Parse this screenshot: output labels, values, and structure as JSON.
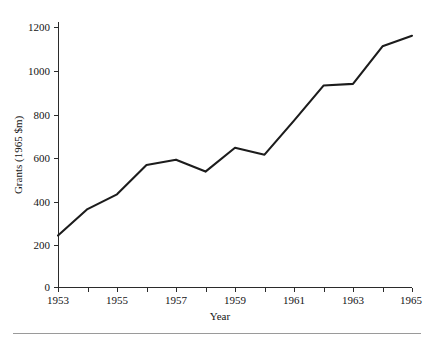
{
  "chart_data": {
    "type": "line",
    "title": "",
    "xlabel": "Year",
    "ylabel": "Grants (1965 $m)",
    "xlim": [
      1953,
      1965
    ],
    "ylim": [
      0,
      1200
    ],
    "grid": false,
    "legend": "none",
    "x_tick_labels": [
      "1953",
      "1955",
      "1957",
      "1959",
      "1961",
      "1963",
      "1965"
    ],
    "x_tick_values": [
      1953,
      1955,
      1957,
      1959,
      1961,
      1963,
      1965
    ],
    "x_minor_tick_values": [
      1954,
      1956,
      1958,
      1960,
      1962,
      1964
    ],
    "y_tick_labels": [
      "0",
      "200",
      "400",
      "600",
      "800",
      "1000",
      "1200"
    ],
    "y_tick_values": [
      0,
      200,
      400,
      600,
      800,
      1000,
      1200
    ],
    "x": [
      1953,
      1954,
      1955,
      1956,
      1957,
      1958,
      1959,
      1960,
      1961,
      1962,
      1963,
      1964,
      1965
    ],
    "values": [
      240,
      362,
      430,
      565,
      590,
      535,
      645,
      613,
      770,
      932,
      940,
      1113,
      1162
    ],
    "series": [
      {
        "name": "Grants",
        "values": [
          240,
          362,
          430,
          565,
          590,
          535,
          645,
          613,
          770,
          932,
          940,
          1113,
          1162
        ]
      }
    ]
  },
  "figure": {
    "y_axis_title": "Grants (1965 $m)",
    "x_axis_title": "Year"
  }
}
